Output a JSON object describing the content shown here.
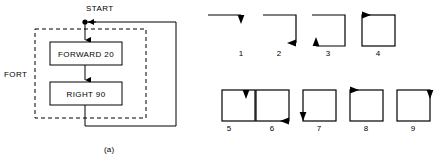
{
  "figure": {
    "panels": [
      {
        "id": "a",
        "caption": "(a)",
        "type": "flowchart",
        "labels": {
          "start": "START",
          "procedure": "FORT",
          "box1": "FORWARD 20",
          "box2": "RIGHT 90"
        },
        "line_color": "#000000",
        "dashed_group_label": "FORT",
        "flow": {
          "entry": "START",
          "steps": [
            "FORWARD 20",
            "RIGHT 90"
          ],
          "loops_back_to": "START"
        }
      },
      {
        "id": "b",
        "caption": "(b)",
        "type": "turtle-trace-sequence",
        "line_color": "#000000",
        "steps": [
          {
            "number": "1",
            "sides_drawn": 1,
            "arrow": "down",
            "arrow_at": "top-right"
          },
          {
            "number": "2",
            "sides_drawn": 2,
            "arrow": "left",
            "arrow_at": "bottom-right"
          },
          {
            "number": "3",
            "sides_drawn": 3,
            "arrow": "up",
            "arrow_at": "bottom-left"
          },
          {
            "number": "4",
            "sides_drawn": 4,
            "arrow": "right",
            "arrow_at": "top-left"
          },
          {
            "number": "5",
            "sides_drawn": 4,
            "arrow": "down",
            "arrow_at": "top-right"
          },
          {
            "number": "6",
            "sides_drawn": 4,
            "arrow": "left",
            "arrow_at": "bottom-right"
          },
          {
            "number": "7",
            "sides_drawn": 4,
            "arrow": "down",
            "arrow_at": "bottom-left"
          },
          {
            "number": "8",
            "sides_drawn": 4,
            "arrow": "right",
            "arrow_at": "top-left"
          },
          {
            "number": "9",
            "sides_drawn": 4,
            "arrow": "down",
            "arrow_at": "top-right"
          }
        ]
      }
    ]
  }
}
